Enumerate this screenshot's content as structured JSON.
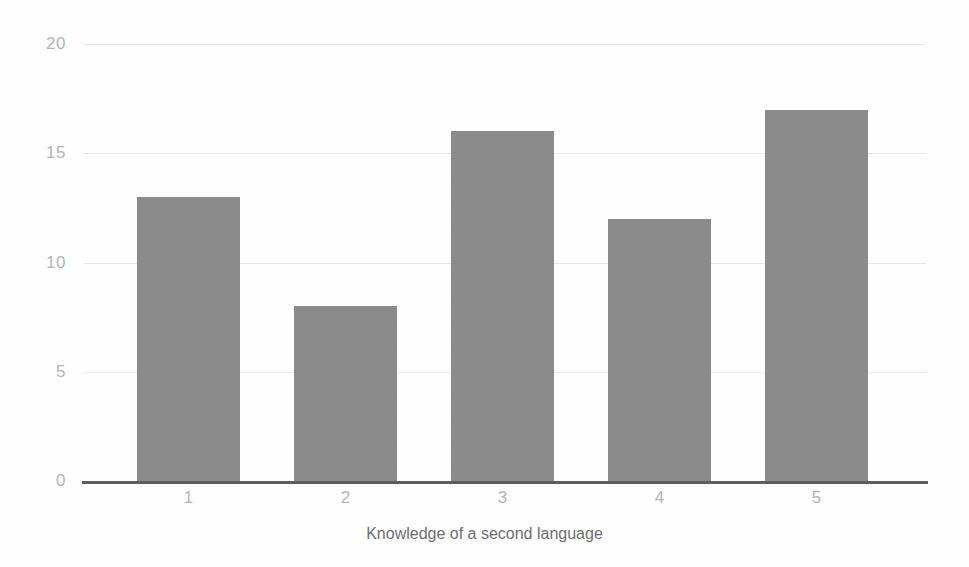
{
  "chart_data": {
    "type": "bar",
    "title": "",
    "subtitle": "",
    "xlabel": "Knowledge of a second language",
    "ylabel": "",
    "categories": [
      "1",
      "2",
      "3",
      "4",
      "5"
    ],
    "values": [
      13,
      8,
      16,
      12,
      17
    ],
    "series": [
      {
        "name": "Count",
        "values": [
          13,
          8,
          16,
          12,
          17
        ]
      }
    ],
    "ylim": [
      0,
      20
    ],
    "yticks": [
      0,
      5,
      10,
      15,
      20
    ],
    "ytick_labels": [
      "0",
      "5",
      "10",
      "15",
      "20"
    ],
    "xtick_labels": [
      "1",
      "2",
      "3",
      "4",
      "5"
    ],
    "grid": true,
    "grid_axis": "y",
    "legend": false,
    "legend_position": "none",
    "bar_color": "#8c8c8c",
    "gridline_color": "#e6e6e6",
    "tick_label_color": "#b4b4b4",
    "axis_line_color": "#5d5d5d",
    "axis_title_color": "#6e6e6e",
    "background_color": "#fefefe",
    "annotations": []
  },
  "layout": {
    "plot_left_px": 84,
    "plot_right_px": 926,
    "baseline_y_px": 481,
    "px_per_unit": 21.85,
    "bar_width_px": 103,
    "bar_step_px": 157,
    "first_bar_left_px": 137
  }
}
